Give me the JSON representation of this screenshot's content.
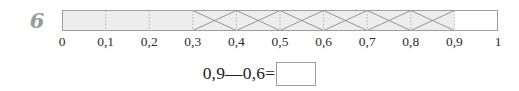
{
  "problem": {
    "number": "6"
  },
  "bar_model": {
    "start_value": 0,
    "end_value": 1,
    "segments": 10,
    "shaded_from": 0.0,
    "shaded_to": 0.9,
    "hatched_from": 0.3,
    "hatched_to": 0.9,
    "empty_from": 0.9,
    "empty_to": 1.0,
    "fill_color": "#ededed",
    "empty_color": "#ffffff",
    "border_color": "#9d9d9d",
    "divider_color": "#b5b5b5",
    "hatch_color": "#8c8c8c"
  },
  "axis": {
    "ticks": [
      {
        "label": "0",
        "value": 0.0
      },
      {
        "label": "0,1",
        "value": 0.1
      },
      {
        "label": "0,2",
        "value": 0.2
      },
      {
        "label": "0,3",
        "value": 0.3
      },
      {
        "label": "0,4",
        "value": 0.4
      },
      {
        "label": "0,5",
        "value": 0.5
      },
      {
        "label": "0,6",
        "value": 0.6
      },
      {
        "label": "0,7",
        "value": 0.7
      },
      {
        "label": "0,8",
        "value": 0.8
      },
      {
        "label": "0,9",
        "value": 0.9
      },
      {
        "label": "1",
        "value": 1.0
      }
    ],
    "label_color": "#2b2b2b"
  },
  "equation": {
    "text": "0,9—0,6=",
    "minuend": "0,9",
    "operator": "—",
    "subtrahend": "0,6",
    "equals": "=",
    "answer_value": ""
  }
}
